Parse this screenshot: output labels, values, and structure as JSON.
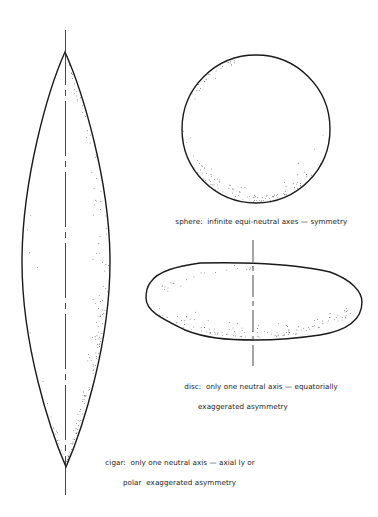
{
  "figure": {
    "shapes": [
      {
        "id": "cigar",
        "label_line1": "cigar:  only one neutral axis — axial ly or",
        "label_line2": "polar  exaggerated asymmetry",
        "top_tip": [
          65,
          52
        ],
        "bottom_tip": [
          66,
          467
        ],
        "max_half_width": 44,
        "axis": {
          "x": 65.5,
          "y1": 30,
          "y2": 495
        }
      },
      {
        "id": "sphere",
        "label_line1": "sphere:  infinite equi-neutral axes — symmetry",
        "center": [
          256,
          129
        ],
        "radius": 74
      },
      {
        "id": "disc",
        "label_line1": "disc:  only one neutral axis — equatorially",
        "label_line2": "exaggerated asymmetry",
        "left_x": 146,
        "right_x": 362,
        "top_y": 263,
        "bottom_y": 340,
        "axis": {
          "x": 253,
          "y1": 240,
          "y2": 366
        }
      }
    ],
    "colors": {
      "stroke": "#1a1a1a",
      "stipple": "#333333",
      "background": "#ffffff"
    }
  }
}
